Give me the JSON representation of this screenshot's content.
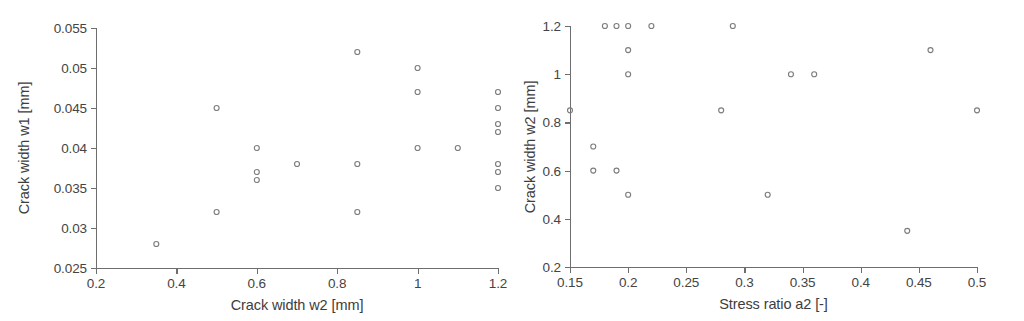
{
  "chart_data": [
    {
      "id": "left",
      "type": "scatter",
      "title": "",
      "xlabel": "Crack width w2 [mm]",
      "ylabel": "Crack width w1 [mm]",
      "xlim": [
        0.2,
        1.2
      ],
      "ylim": [
        0.025,
        0.055
      ],
      "xticks": [
        0.2,
        0.4,
        0.6,
        0.8,
        1.0,
        1.2
      ],
      "xticklabels": [
        "0.2",
        "0.4",
        "0.6",
        "0.8",
        "1",
        "1.2"
      ],
      "yticks": [
        0.025,
        0.03,
        0.035,
        0.04,
        0.045,
        0.05,
        0.055
      ],
      "yticklabels": [
        "0.025",
        "0.03",
        "0.035",
        "0.04",
        "0.045",
        "0.05",
        "0.055"
      ],
      "grid": false,
      "legend": null,
      "marker": "open-circle",
      "marker_color": "#7d7d7d",
      "points": [
        {
          "x": 0.35,
          "y": 0.028
        },
        {
          "x": 0.5,
          "y": 0.045
        },
        {
          "x": 0.5,
          "y": 0.032
        },
        {
          "x": 0.6,
          "y": 0.04
        },
        {
          "x": 0.6,
          "y": 0.037
        },
        {
          "x": 0.6,
          "y": 0.036
        },
        {
          "x": 0.7,
          "y": 0.038
        },
        {
          "x": 0.85,
          "y": 0.052
        },
        {
          "x": 0.85,
          "y": 0.038
        },
        {
          "x": 0.85,
          "y": 0.032
        },
        {
          "x": 1.0,
          "y": 0.05
        },
        {
          "x": 1.0,
          "y": 0.047
        },
        {
          "x": 1.0,
          "y": 0.04
        },
        {
          "x": 1.1,
          "y": 0.04
        },
        {
          "x": 1.2,
          "y": 0.047
        },
        {
          "x": 1.2,
          "y": 0.045
        },
        {
          "x": 1.2,
          "y": 0.043
        },
        {
          "x": 1.2,
          "y": 0.042
        },
        {
          "x": 1.2,
          "y": 0.038
        },
        {
          "x": 1.2,
          "y": 0.037
        },
        {
          "x": 1.2,
          "y": 0.035
        }
      ]
    },
    {
      "id": "right",
      "type": "scatter",
      "title": "",
      "xlabel": "Stress ratio a2 [-]",
      "ylabel": "Crack width w2 [mm]",
      "xlim": [
        0.15,
        0.5
      ],
      "ylim": [
        0.2,
        1.2
      ],
      "xticks": [
        0.15,
        0.2,
        0.25,
        0.3,
        0.35,
        0.4,
        0.45,
        0.5
      ],
      "xticklabels": [
        "0.15",
        "0.2",
        "0.25",
        "0.3",
        "0.35",
        "0.4",
        "0.45",
        "0.5"
      ],
      "yticks": [
        0.2,
        0.4,
        0.6,
        0.8,
        1.0,
        1.2
      ],
      "yticklabels": [
        "0.2",
        "0.4",
        "0.6",
        "0.8",
        "1",
        "1.2"
      ],
      "grid": false,
      "legend": null,
      "marker": "open-circle",
      "marker_color": "#7d7d7d",
      "points": [
        {
          "x": 0.15,
          "y": 0.85
        },
        {
          "x": 0.17,
          "y": 0.7
        },
        {
          "x": 0.17,
          "y": 0.6
        },
        {
          "x": 0.18,
          "y": 1.2
        },
        {
          "x": 0.19,
          "y": 1.2
        },
        {
          "x": 0.19,
          "y": 0.6
        },
        {
          "x": 0.2,
          "y": 1.2
        },
        {
          "x": 0.2,
          "y": 1.1
        },
        {
          "x": 0.2,
          "y": 1.0
        },
        {
          "x": 0.2,
          "y": 0.5
        },
        {
          "x": 0.22,
          "y": 1.2
        },
        {
          "x": 0.28,
          "y": 0.85
        },
        {
          "x": 0.29,
          "y": 1.2
        },
        {
          "x": 0.32,
          "y": 0.5
        },
        {
          "x": 0.34,
          "y": 1.0
        },
        {
          "x": 0.36,
          "y": 1.0
        },
        {
          "x": 0.44,
          "y": 0.35
        },
        {
          "x": 0.46,
          "y": 1.1
        },
        {
          "x": 0.5,
          "y": 0.85
        }
      ]
    }
  ]
}
